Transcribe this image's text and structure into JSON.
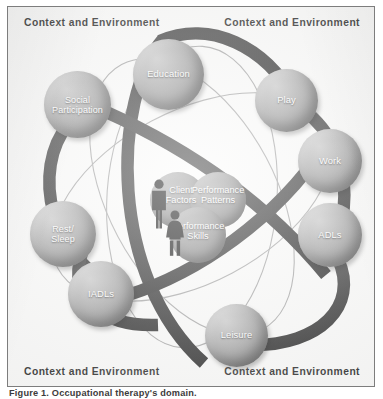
{
  "figure": {
    "caption": "Figure 1. Occupational therapy's domain.",
    "corner_labels": {
      "top_left": "Context and Environment",
      "top_right": "Context and Environment",
      "bottom_left": "Context and Environment",
      "bottom_right": "Context and Environment"
    }
  },
  "colors": {
    "frame_border": "#7d7d7d",
    "frame_background": "#fbfbfa",
    "sphere_light": "#c9c9c9",
    "sphere_dark": "#5e5e5e",
    "orbit_band": "#2f2f2f",
    "orbit_line": "#9a9a9a",
    "label_text": "#ffffff",
    "corner_text": "#1b1b1b"
  },
  "occupations": [
    {
      "id": "education",
      "label": "Education"
    },
    {
      "id": "social-participation",
      "label": "Social\nParticipation"
    },
    {
      "id": "play",
      "label": "Play"
    },
    {
      "id": "work",
      "label": "Work"
    },
    {
      "id": "adls",
      "label": "ADLs"
    },
    {
      "id": "leisure",
      "label": "Leisure"
    },
    {
      "id": "iadls",
      "label": "IADLs"
    },
    {
      "id": "rest-sleep",
      "label": "Rest/\nSleep"
    }
  ],
  "occupation_labels": {
    "education": "Education",
    "social_participation_line1": "Social",
    "social_participation_line2": "Participation",
    "play": "Play",
    "work": "Work",
    "adls": "ADLs",
    "leisure": "Leisure",
    "iadls": "IADLs",
    "rest_sleep_line1": "Rest/",
    "rest_sleep_line2": "Sleep"
  },
  "core": {
    "client_factors_line1": "Client",
    "client_factors_line2": "Factors",
    "performance_patterns_line1": "Performance",
    "performance_patterns_line2": "Patterns",
    "performance_skills_line1": "Performance",
    "performance_skills_line2": "Skills"
  },
  "icons": {
    "male_figure": "person-male-icon",
    "female_figure": "person-female-icon"
  }
}
